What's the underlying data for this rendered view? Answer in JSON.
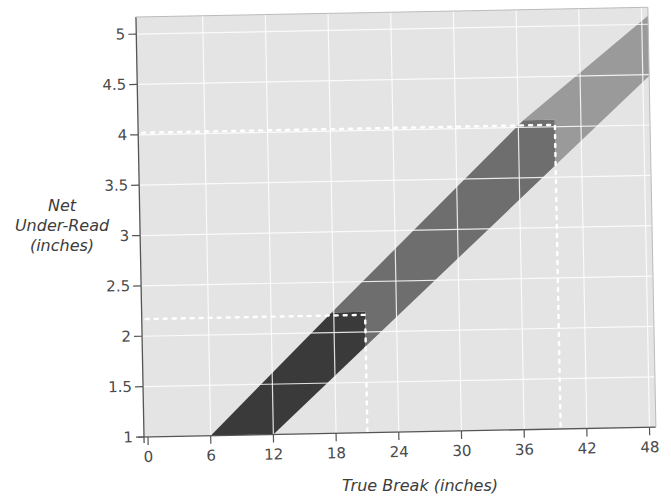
{
  "chart_data": {
    "type": "area",
    "title": "",
    "xlabel": "True Break (inches)",
    "ylabel_lines": [
      "Net",
      "Under-Read",
      "(inches)"
    ],
    "ylabel": "Net Under-Read (inches)",
    "x_ticks": [
      0,
      6,
      12,
      18,
      24,
      30,
      36,
      42,
      48
    ],
    "y_ticks": [
      1,
      1.5,
      2,
      2.5,
      3,
      3.5,
      4,
      4.5,
      5
    ],
    "y_tick_labels": [
      "1",
      "1.5",
      "2",
      "2.5",
      "3",
      "3.5",
      "4",
      "4.5",
      "5"
    ],
    "xlim": [
      0,
      49
    ],
    "ylim": [
      1,
      5.15
    ],
    "grid": true,
    "legend": "none",
    "band": {
      "description": "Diagonal band of net under-read vs true break",
      "lower_edge": [
        [
          12,
          1
        ],
        [
          50,
          4.62
        ]
      ],
      "upper_edge": [
        [
          6,
          1
        ],
        [
          50,
          5.2
        ]
      ],
      "segments": [
        {
          "name": "dark",
          "x_range": [
            6,
            21
          ],
          "color": "#3a3a3a"
        },
        {
          "name": "medium",
          "x_range": [
            21,
            39.5
          ],
          "color": "#6e6e6e"
        },
        {
          "name": "light",
          "x_range": [
            39.5,
            50
          ],
          "color": "#9a9a9a"
        }
      ]
    },
    "reference_lines": [
      {
        "x": 21,
        "y": 2.17,
        "style": "dotted",
        "color": "#ffffff"
      },
      {
        "x": 39.5,
        "y": 4.02,
        "style": "dotted",
        "color": "#ffffff"
      }
    ],
    "colors": {
      "plot_background": "#e4e4e4",
      "gridline": "#ffffff",
      "axis": "#555555"
    }
  }
}
